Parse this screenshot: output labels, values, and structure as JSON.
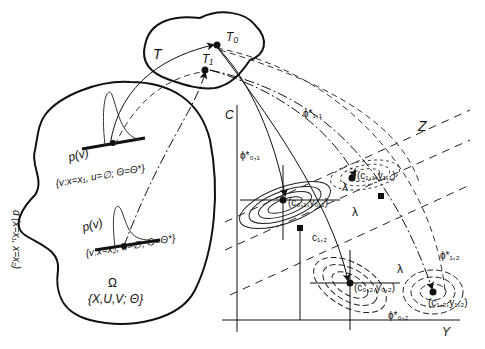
{
  "sets": {
    "T": {
      "label": "T",
      "points": {
        "T0": "T₀",
        "T1": "T₁"
      }
    },
    "Omega": {
      "label": "Ω",
      "contents": "{X,U,V; Θ}"
    }
  },
  "distributions": [
    {
      "label": "p(v)",
      "condition": "{v:x=x₁, u=∅; Θ=Θ*}"
    },
    {
      "label": "p(v)",
      "condition": "{v:x=x₂, u=∅; Θ=Θ*}"
    }
  ],
  "distance_label": "d (x=x₁, x=x₂)",
  "axes": {
    "vertical": "C",
    "horizontal": "Y",
    "third": "Z"
  },
  "points": [
    {
      "label": "(c₀,₁,y₀,₁)",
      "phi": "ϕ*₀,₁"
    },
    {
      "label": "(c₁,₁,y₁,₁)",
      "phi": "ϕ*₁,₁"
    },
    {
      "label": "(c₀,₂,y₀,₂)",
      "phi": "ϕ*₀,₂"
    },
    {
      "label": "(c₁,₂,y₁,₂)",
      "phi": "ϕ*₁,₂"
    }
  ],
  "annotations": {
    "lambda": "λ",
    "c12": "c₁,₂"
  }
}
